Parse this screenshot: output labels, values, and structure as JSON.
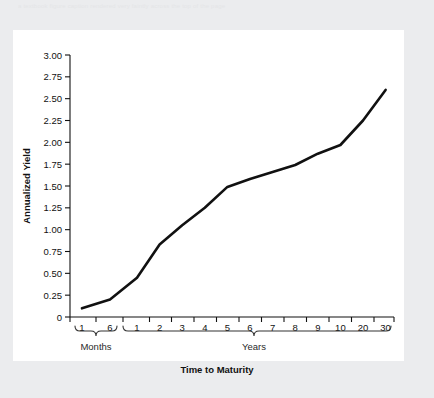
{
  "page": {
    "faint_header_text": "a textbook figure caption rendered very faintly across the top of the page"
  },
  "chart_data": {
    "type": "line",
    "title": "",
    "xlabel": "Time to Maturity",
    "ylabel": "Annualized Yield",
    "ylim": [
      0,
      3.0
    ],
    "ytick_labels": [
      "0",
      "0.25",
      "0.50",
      "0.75",
      "1.00",
      "1.25",
      "1.50",
      "1.75",
      "2.00",
      "2.25",
      "2.50",
      "2.75",
      "3.00"
    ],
    "ytick_values": [
      0,
      0.25,
      0.5,
      0.75,
      1.0,
      1.25,
      1.5,
      1.75,
      2.0,
      2.25,
      2.5,
      2.75,
      3.0
    ],
    "grid": false,
    "legend": null,
    "x_groups": [
      {
        "name": "Months",
        "tick_labels": [
          "1",
          "6"
        ]
      },
      {
        "name": "Years",
        "tick_labels": [
          "1",
          "2",
          "3",
          "4",
          "5",
          "6",
          "7",
          "8",
          "9",
          "10",
          "20",
          "30"
        ]
      }
    ],
    "categories": [
      "1m",
      "6m",
      "1y",
      "2y",
      "3y",
      "4y",
      "5y",
      "6y",
      "7y",
      "8y",
      "9y",
      "10y",
      "20y",
      "30y"
    ],
    "values": [
      0.1,
      0.2,
      0.45,
      0.83,
      1.05,
      1.25,
      1.49,
      1.58,
      1.66,
      1.74,
      1.87,
      1.97,
      2.25,
      2.6
    ],
    "series": [
      {
        "name": "Yield curve",
        "color": "#111111",
        "values": [
          0.1,
          0.2,
          0.45,
          0.83,
          1.05,
          1.25,
          1.49,
          1.58,
          1.66,
          1.74,
          1.87,
          1.97,
          2.25,
          2.6
        ]
      }
    ]
  }
}
